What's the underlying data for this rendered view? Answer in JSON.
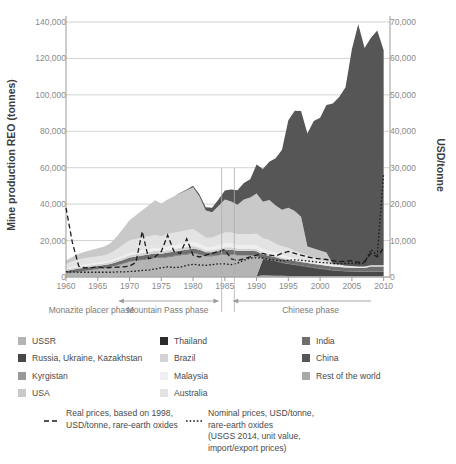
{
  "chart_data": {
    "type": "area",
    "title": "",
    "xlabel": "",
    "ylabel": "Mine production REO (tonnes)",
    "ylabel_right": "USD/tonne",
    "xlim": [
      1960,
      2011
    ],
    "ylim": [
      0,
      140000
    ],
    "ylim_right": [
      0,
      70000
    ],
    "grid": true,
    "legend_position": "below",
    "stacked": true,
    "yticks": [
      "0",
      "20,000",
      "40,000",
      "60,000",
      "80,000",
      "100,000",
      "120,000",
      "140,000"
    ],
    "ytick_values": [
      0,
      20000,
      40000,
      60000,
      80000,
      100000,
      120000,
      140000
    ],
    "yticks_right": [
      "0",
      "10,000",
      "20,000",
      "30,000",
      "40,000",
      "50,000",
      "60,000",
      "70,000"
    ],
    "ytick_values_right": [
      0,
      10000,
      20000,
      30000,
      40000,
      50000,
      60000,
      70000
    ],
    "xticks": [
      "1960",
      "1965",
      "1970",
      "1975",
      "1980",
      "1985",
      "1990",
      "1995",
      "2000",
      "2005",
      "2010"
    ],
    "xtick_values": [
      1960,
      1965,
      1970,
      1975,
      1980,
      1985,
      1990,
      1995,
      2000,
      2005,
      2010
    ],
    "x": [
      1960,
      1961,
      1962,
      1963,
      1964,
      1965,
      1966,
      1967,
      1968,
      1969,
      1970,
      1971,
      1972,
      1973,
      1974,
      1975,
      1976,
      1977,
      1978,
      1979,
      1980,
      1981,
      1982,
      1983,
      1984,
      1985,
      1986,
      1987,
      1988,
      1989,
      1990,
      1991,
      1992,
      1993,
      1994,
      1995,
      1996,
      1997,
      1998,
      1999,
      2000,
      2001,
      2002,
      2003,
      2004,
      2005,
      2006,
      2007,
      2008,
      2009,
      2010
    ],
    "series": [
      {
        "name": "China",
        "color": "#565656",
        "values": [
          0,
          0,
          0,
          0,
          0,
          0,
          0,
          0,
          0,
          0,
          0,
          0,
          0,
          0,
          0,
          0,
          0,
          0,
          300,
          500,
          800,
          1200,
          1800,
          2500,
          3500,
          5000,
          6500,
          8000,
          9000,
          10000,
          16000,
          18000,
          21000,
          26000,
          33000,
          48000,
          55000,
          58000,
          62000,
          70000,
          73000,
          81000,
          88000,
          92000,
          98000,
          119000,
          133000,
          120000,
          125000,
          129000,
          118000
        ]
      },
      {
        "name": "USA",
        "color": "#c9c9c9",
        "values": [
          2000,
          2500,
          3000,
          3500,
          4000,
          4500,
          5000,
          5500,
          7000,
          9000,
          11000,
          13000,
          15000,
          17000,
          19000,
          18000,
          19000,
          20000,
          21000,
          22000,
          23000,
          20000,
          15000,
          14000,
          16000,
          18000,
          17000,
          16000,
          19000,
          20000,
          22000,
          20000,
          22000,
          21000,
          20000,
          22000,
          22000,
          20000,
          5000,
          5000,
          5000,
          5000,
          0,
          0,
          0,
          0,
          0,
          0,
          0,
          0,
          0
        ]
      },
      {
        "name": "Australia",
        "color": "#e3e3e3",
        "values": [
          2500,
          3000,
          3500,
          3500,
          3500,
          3500,
          3500,
          4000,
          5000,
          6000,
          7000,
          7000,
          7000,
          7000,
          7000,
          6500,
          7000,
          7000,
          7000,
          7000,
          7000,
          6000,
          5000,
          5000,
          5500,
          6000,
          6000,
          6000,
          6000,
          6000,
          6500,
          6000,
          6000,
          5000,
          5000,
          5000,
          4000,
          3500,
          3000,
          2500,
          2000,
          1500,
          1000,
          800,
          600,
          500,
          400,
          300,
          300,
          300,
          300
        ]
      },
      {
        "name": "Malaysia",
        "color": "#efefef",
        "values": [
          500,
          600,
          700,
          700,
          700,
          700,
          700,
          800,
          900,
          1000,
          1200,
          1400,
          1500,
          1600,
          1700,
          1700,
          1800,
          1900,
          2000,
          2100,
          2200,
          2000,
          1800,
          1800,
          2000,
          2200,
          2200,
          2000,
          2000,
          2000,
          2000,
          1800,
          1600,
          1400,
          1200,
          1000,
          900,
          800,
          700,
          600,
          500,
          400,
          300,
          300,
          200,
          200,
          200,
          200,
          200,
          200,
          200
        ]
      },
      {
        "name": "Brazil",
        "color": "#d4d4d4",
        "values": [
          800,
          900,
          1000,
          1000,
          1000,
          1000,
          1000,
          1000,
          1100,
          1200,
          1300,
          1300,
          1400,
          1400,
          1500,
          1400,
          1400,
          1500,
          1500,
          1500,
          1500,
          1300,
          1100,
          1100,
          1200,
          1300,
          1300,
          1200,
          1200,
          1200,
          1200,
          1100,
          1000,
          900,
          800,
          700,
          600,
          500,
          400,
          400,
          300,
          300,
          200,
          200,
          200,
          200,
          200,
          200,
          200,
          200,
          200
        ]
      },
      {
        "name": "India",
        "color": "#6f6f6f",
        "values": [
          1500,
          1600,
          1700,
          1700,
          1700,
          1700,
          1700,
          1800,
          1900,
          2000,
          2100,
          2100,
          2200,
          2200,
          2300,
          2200,
          2300,
          2300,
          2400,
          2400,
          2500,
          2300,
          2000,
          2000,
          2200,
          2400,
          2400,
          2300,
          2300,
          2300,
          2500,
          2300,
          2200,
          2000,
          2000,
          2000,
          2000,
          2000,
          2000,
          2000,
          2000,
          2000,
          2000,
          2000,
          2000,
          2000,
          2000,
          2000,
          2700,
          2700,
          2800
        ]
      },
      {
        "name": "Thailand",
        "color": "#2b2b2b",
        "values": [
          100,
          100,
          100,
          100,
          100,
          100,
          100,
          100,
          100,
          100,
          150,
          150,
          200,
          200,
          200,
          200,
          200,
          200,
          200,
          200,
          200,
          200,
          200,
          200,
          200,
          200,
          200,
          200,
          200,
          200,
          200,
          200,
          200,
          200,
          200,
          200,
          200,
          200,
          200,
          200,
          200,
          200,
          200,
          200,
          100,
          100,
          100,
          100,
          100,
          100,
          100
        ]
      },
      {
        "name": "USSR",
        "color": "#b4b4b4",
        "values": [
          1500,
          2000,
          2500,
          3000,
          3500,
          4000,
          4500,
          5000,
          6000,
          7000,
          8000,
          8500,
          9000,
          9500,
          10000,
          10000,
          10500,
          11000,
          11500,
          12000,
          12500,
          12000,
          11000,
          11000,
          11500,
          12000,
          12000,
          11500,
          11500,
          11500,
          11000,
          0,
          0,
          0,
          0,
          0,
          0,
          0,
          0,
          0,
          0,
          0,
          0,
          0,
          0,
          0,
          0,
          0,
          0,
          0,
          0
        ]
      },
      {
        "name": "Russia, Ukraine, Kazakhstan",
        "color": "#484848",
        "values": [
          0,
          0,
          0,
          0,
          0,
          0,
          0,
          0,
          0,
          0,
          0,
          0,
          0,
          0,
          0,
          0,
          0,
          0,
          0,
          0,
          0,
          0,
          0,
          0,
          0,
          0,
          0,
          0,
          0,
          0,
          0,
          9000,
          8500,
          8000,
          7000,
          6500,
          6000,
          5500,
          5000,
          4500,
          4000,
          3500,
          3000,
          2800,
          2600,
          2500,
          2400,
          2400,
          2400,
          2400,
          2400
        ]
      },
      {
        "name": "Kyrgistan",
        "color": "#999999",
        "values": [
          0,
          0,
          0,
          0,
          0,
          0,
          0,
          0,
          0,
          0,
          0,
          0,
          0,
          0,
          0,
          0,
          0,
          0,
          0,
          0,
          0,
          0,
          0,
          0,
          0,
          0,
          0,
          0,
          0,
          0,
          0,
          500,
          400,
          300,
          300,
          200,
          200,
          200,
          100,
          100,
          100,
          100,
          100,
          100,
          100,
          100,
          100,
          100,
          100,
          100,
          100
        ]
      },
      {
        "name": "Rest of the world",
        "color": "#a8a8a8",
        "values": [
          300,
          300,
          300,
          300,
          300,
          300,
          300,
          300,
          300,
          300,
          400,
          400,
          400,
          400,
          400,
          400,
          400,
          400,
          400,
          400,
          400,
          400,
          400,
          400,
          400,
          400,
          400,
          400,
          400,
          400,
          400,
          400,
          400,
          400,
          400,
          400,
          400,
          400,
          400,
          400,
          400,
          400,
          400,
          400,
          400,
          400,
          400,
          400,
          400,
          400,
          400
        ]
      }
    ],
    "price_series": [
      {
        "name": "Real prices, based on 1998, USD/tonne, rare-earth oxides",
        "axis": "right",
        "style": "dashed",
        "color": "#1a1a1a",
        "values": [
          19000,
          9500,
          3000,
          2500,
          2600,
          2800,
          2500,
          2600,
          2700,
          2800,
          3000,
          4000,
          12500,
          5000,
          5500,
          7000,
          11500,
          7000,
          6500,
          10500,
          6000,
          5500,
          6000,
          6500,
          7000,
          7500,
          5000,
          4500,
          5000,
          5500,
          6000,
          6500,
          6000,
          5800,
          6500,
          7000,
          6500,
          6000,
          5500,
          5200,
          5000,
          4800,
          4500,
          4200,
          4300,
          4500,
          4000,
          4200,
          6500,
          5500,
          8000
        ]
      },
      {
        "name": "Nominal prices, USD/tonne, rare-earth oxides (USGS 2014, unit value, import/export prices)",
        "axis": "right",
        "style": "dotted",
        "color": "#1a1a1a",
        "values": [
          1500,
          1400,
          1300,
          1300,
          1300,
          1300,
          1300,
          1300,
          1400,
          1400,
          1500,
          1600,
          1800,
          1900,
          2200,
          2500,
          2800,
          2600,
          2700,
          3200,
          3500,
          3300,
          3200,
          3400,
          3600,
          3600,
          3400,
          3800,
          4600,
          5200,
          5300,
          5200,
          4800,
          4600,
          4400,
          4600,
          4700,
          4600,
          4400,
          4200,
          4000,
          3900,
          3700,
          3600,
          3700,
          3800,
          3600,
          3800,
          7500,
          6000,
          28500
        ]
      }
    ],
    "annotations": [
      {
        "label": "Monazite placer phase",
        "x_start": 1960,
        "x_end": 1968
      },
      {
        "label": "Mountain Pass phase",
        "x_start": 1968,
        "x_end": 1984
      },
      {
        "label": "Chinese phase",
        "x_start": 1986,
        "x_end": 2011
      }
    ]
  },
  "legend": {
    "columns": [
      {
        "items": [
          {
            "label": "USSR",
            "color": "#b4b4b4"
          },
          {
            "label": "Russia, Ukraine, Kazakhstan",
            "color": "#484848"
          },
          {
            "label": "Kyrgistan",
            "color": "#999999"
          },
          {
            "label": "USA",
            "color": "#c9c9c9"
          }
        ]
      },
      {
        "items": [
          {
            "label": "Thailand",
            "color": "#2b2b2b"
          },
          {
            "label": "Brazil",
            "color": "#d4d4d4"
          },
          {
            "label": "Malaysia",
            "color": "#efefef"
          },
          {
            "label": "Australia",
            "color": "#e3e3e3"
          }
        ]
      },
      {
        "items": [
          {
            "label": "India",
            "color": "#6f6f6f"
          },
          {
            "label": "China",
            "color": "#565656"
          },
          {
            "label": "Rest of the world",
            "color": "#a8a8a8"
          }
        ]
      }
    ]
  },
  "price_legend": {
    "items": [
      {
        "style": "dashed",
        "text": "Real prices, based on 1998,\nUSD/tonne, rare-earth oxides"
      },
      {
        "style": "dotted",
        "text": "Nominal prices, USD/tonne,\nrare-earth oxides\n(USGS 2014, unit value,\nimport/export prices)"
      }
    ]
  }
}
